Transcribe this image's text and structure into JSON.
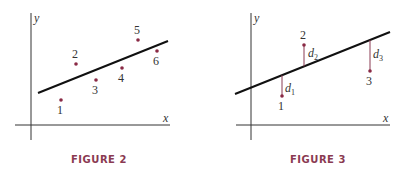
{
  "figures": [
    {
      "caption": "FIGURE 2",
      "x_axis_label": "x",
      "y_axis_label": "y",
      "points": [
        {
          "label": "1",
          "x": 61,
          "y": 100
        },
        {
          "label": "2",
          "x": 76,
          "y": 64
        },
        {
          "label": "3",
          "x": 96,
          "y": 80
        },
        {
          "label": "4",
          "x": 122,
          "y": 68
        },
        {
          "label": "5",
          "x": 138,
          "y": 40
        },
        {
          "label": "6",
          "x": 157,
          "y": 51
        }
      ]
    },
    {
      "caption": "FIGURE 3",
      "x_axis_label": "x",
      "y_axis_label": "y",
      "points": [
        {
          "label": "1",
          "x": 282,
          "y": 96
        },
        {
          "label": "2",
          "x": 304,
          "y": 45
        },
        {
          "label": "3",
          "x": 370,
          "y": 71
        }
      ],
      "residuals": [
        {
          "label": "d",
          "sub": "1"
        },
        {
          "label": "d",
          "sub": "2"
        },
        {
          "label": "d",
          "sub": "3"
        }
      ]
    }
  ],
  "colors": {
    "points": "#8a2a45",
    "caption": "#8a3a52",
    "line": "#111111"
  }
}
